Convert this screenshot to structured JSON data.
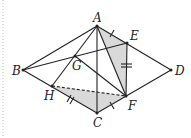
{
  "figure": {
    "type": "geometry-diagram",
    "points": {
      "A": {
        "label": "A",
        "x": 97,
        "y": 26
      },
      "B": {
        "label": "B",
        "x": 23,
        "y": 70
      },
      "C": {
        "label": "C",
        "x": 97,
        "y": 113
      },
      "D": {
        "label": "D",
        "x": 171,
        "y": 70
      },
      "E": {
        "label": "E",
        "x": 127,
        "y": 43
      },
      "F": {
        "label": "F",
        "x": 126,
        "y": 96
      },
      "G": {
        "label": "G",
        "x": 75,
        "y": 56
      },
      "H": {
        "label": "H",
        "x": 52,
        "y": 86
      }
    },
    "labels": {
      "A": "A",
      "B": "B",
      "C": "C",
      "D": "D",
      "E": "E",
      "F": "F",
      "G": "G",
      "H": "H"
    },
    "shaded_regions": [
      [
        "A",
        "E",
        "F"
      ],
      [
        "H",
        "C",
        "F"
      ]
    ],
    "solid_segments": [
      [
        "A",
        "B"
      ],
      [
        "A",
        "D"
      ],
      [
        "B",
        "C"
      ],
      [
        "C",
        "D"
      ],
      [
        "A",
        "C"
      ],
      [
        "A",
        "F"
      ],
      [
        "B",
        "E"
      ],
      [
        "G",
        "F"
      ],
      [
        "G",
        "H"
      ],
      [
        "A",
        "G"
      ],
      [
        "E",
        "F"
      ]
    ],
    "dashed_segments": [
      [
        "H",
        "F"
      ]
    ],
    "tick_marks": [
      {
        "segment": [
          "A",
          "E"
        ],
        "count": 1
      },
      {
        "segment": [
          "C",
          "F"
        ],
        "count": 1
      },
      {
        "segment": [
          "E",
          "F"
        ],
        "count": 2
      },
      {
        "segment": [
          "H",
          "C"
        ],
        "count": 2
      }
    ],
    "colors": {
      "line": "#222222",
      "shade": "#d9d9d9",
      "border_dots": "#bbbbbb"
    }
  }
}
